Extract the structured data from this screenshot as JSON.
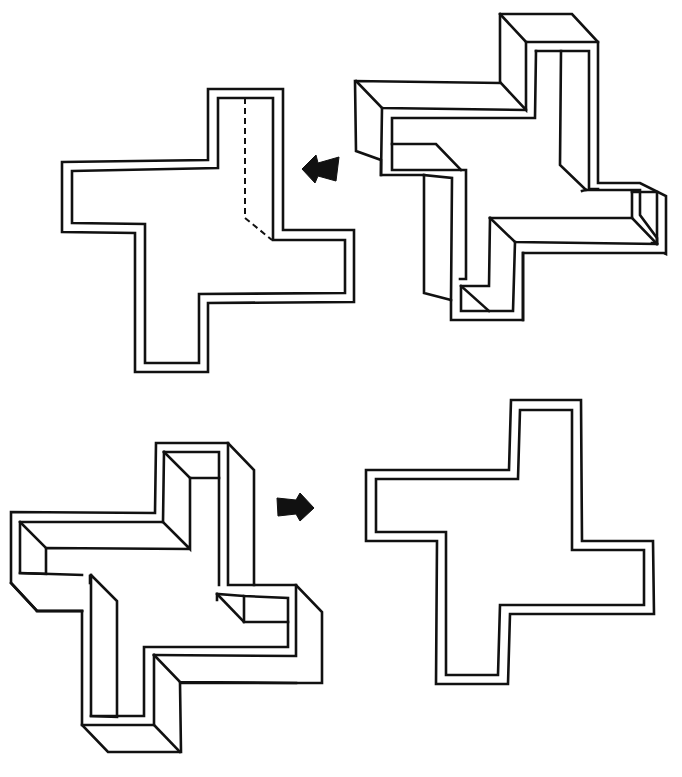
{
  "figure": {
    "stroke_color": "#111111",
    "background": "#ffffff"
  },
  "shapes": [
    {
      "id": "top-left-flat",
      "kind": "flat-outline",
      "outer": "M62,162 L208,160 L208,89 L283,89 L283,230 L354,230 L354,302 L208,303 L208,372 L135,372 L135,233 L62,232 Z",
      "inner": "M72,171 L218,168 L218,98 L273,98 L273,240 L345,240 L345,293 L199,294 L199,363 L145,363 L145,224 L72,223 Z",
      "dashed": "M245,98 L245,218 L272,240"
    },
    {
      "id": "top-right-3d",
      "kind": "extruded",
      "paths": [
        "M500,14 L572,14 L598,42 L598,183 L640,183 L666,196 L666,254 L664,253 L523,253 L523,320 L451,320 L451,300 L424,293 L424,175 L381,175 L381,160 L356,151 L355,81 L500,83 Z",
        "M500,14 L526,42 L598,42",
        "M526,42 L526,110 L501,83",
        "M356,81 L382,108 L526,110",
        "M382,108 L381,175",
        "M536,51 L589,51 L589,189 L598,189",
        "M536,51 L535,118 L392,118 L392,170 L466,170 L466,279 L460,279",
        "M561,51 L560,165 L586,190 L640,190 L640,215 L657,238 L657,243 L652,243",
        "M392,144 L436,144 L461,170",
        "M424,175 L452,178 L451,300",
        "M586,190 L582,191",
        "M632,192 L657,192 L657,244",
        "M632,192 L632,218 L657,244",
        "M490,218 L632,218",
        "M490,218 L515,242 L657,244",
        "M490,218 L489,286 L461,286 L461,311 L513,311 L515,242",
        "M461,286 L489,311",
        "M523,253 L523,320"
      ]
    },
    {
      "id": "bottom-left-3d",
      "kind": "extruded",
      "paths": [
        "M156,443 L228,443 L254,470 L254,585 L296,585 L322,612 L322,683 L180,683 L181,752 L108,752 L82,725 L82,611 L37,611 L11,583 L11,512 L155,513 Z",
        "M164,452 L219,452 L219,585",
        "M164,452 L190,478 L219,478",
        "M190,478 L190,549 L163,522 L20,522 L20,573 L46,574 L46,548 L190,549",
        "M20,522 L46,548",
        "M228,443 L228,585 L254,585",
        "M163,522 L164,452",
        "M20,573 L82,575",
        "M91,575 L117,601 L117,717 L91,716 L91,575",
        "M90,576 L90,583",
        "M91,716 L144,716 L144,647 L288,647 L288,598 L244,596 L217,594 L217,600",
        "M244,596 L244,622 L288,622",
        "M217,594 L244,622",
        "M154,655 L180,682 L296,683",
        "M154,655 L296,656 L296,585",
        "M154,655 L154,725 L82,725",
        "M154,725 L180,752",
        "M11,583 L37,611 L82,611",
        "M37,611 L82,611"
      ]
    },
    {
      "id": "bottom-right-flat",
      "kind": "flat-outline",
      "outer": "M366,470 L509,470 L511,400 L581,400 L582,541 L653,541 L654,614 L510,614 L508,684 L436,684 L437,541 L366,541 Z",
      "inner": "M376,479 L518,479 L520,410 L572,410 L572,550 L644,550 L644,605 L500,605 L498,675 L446,675 L446,532 L376,532 Z"
    }
  ],
  "arrows": [
    {
      "id": "arrow-left",
      "direction": "left",
      "path": "M302,169 L316,155 L318,163 L339,157 L336,181 L318,176 L315,183 Z"
    },
    {
      "id": "arrow-right",
      "direction": "right",
      "path": "M277,498 L296,500 L300,493 L314,508 L300,521 L296,514 L278,516 Z"
    }
  ]
}
